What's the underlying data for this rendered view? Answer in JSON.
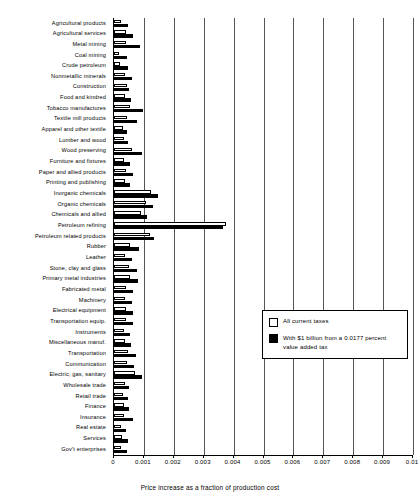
{
  "chart_data": {
    "type": "bar",
    "orientation": "horizontal",
    "title": "",
    "xlabel": "Price increase as a fraction of production cost",
    "ylabel": "",
    "xlim": [
      0,
      0.01
    ],
    "xticks": [
      "0",
      "0.001",
      "0.002",
      "0.003",
      "0.004",
      "0.005",
      "0.006",
      "0.007",
      "0.008",
      "0.009",
      "0.01"
    ],
    "xtick_values": [
      0,
      0.001,
      0.002,
      0.003,
      0.004,
      0.005,
      0.006,
      0.007,
      0.008,
      0.009,
      0.01
    ],
    "grid": "vertical",
    "legend_position": "center-right",
    "categories": [
      "Agricultural products",
      "Agricultural services",
      "Metal mining",
      "Coal mining",
      "Crude petroleum",
      "Nonmetallic minerals",
      "Construction",
      "Food and kindred",
      "Tobacco manufactures",
      "Textile mill products",
      "Apparel and other textile",
      "Lumber and wood",
      "Wood preserving",
      "Furniture and fixtures",
      "Paper and allied products",
      "Printing and publishing",
      "Inorganic chemicals",
      "Organic chemicals",
      "Chemicals and allied",
      "Petroleum refining",
      "Petroleum related products",
      "Rubber",
      "Leather",
      "Stone, clay and glass",
      "Primary metal industries",
      "Fabricated metal",
      "Machinery",
      "Electrical equipment",
      "Transportation equip.",
      "Instruments",
      "Miscellaneous manuf.",
      "Transportation",
      "Communication",
      "Electric, gas, sanitary",
      "Wholesale trade",
      "Retail trade",
      "Finance",
      "Insurance",
      "Real estate",
      "Services",
      "Gov't enterprises"
    ],
    "series": [
      {
        "name": "All current taxes",
        "fill": "#ffffff",
        "values": [
          0.00022,
          0.0004,
          0.00041,
          0.00018,
          0.0002,
          0.00036,
          0.00042,
          0.00036,
          0.00055,
          0.00042,
          0.00029,
          0.00033,
          0.0006,
          0.00035,
          0.0004,
          0.00037,
          0.00125,
          0.00108,
          0.0009,
          0.00375,
          0.00122,
          0.00055,
          0.00038,
          0.0005,
          0.00054,
          0.00041,
          0.00037,
          0.00041,
          0.00041,
          0.00033,
          0.00037,
          0.00048,
          0.00045,
          0.0007,
          0.00036,
          0.0003,
          0.00033,
          0.00035,
          0.00024,
          0.00027,
          0.00024
        ]
      },
      {
        "name": "With $1 billion from a 0.0177 percent value added tax",
        "fill": "#000000",
        "values": [
          0.00048,
          0.00063,
          0.00087,
          0.00043,
          0.00046,
          0.0006,
          0.0005,
          0.00058,
          0.00098,
          0.00078,
          0.00043,
          0.00048,
          0.00095,
          0.00055,
          0.00062,
          0.00052,
          0.00147,
          0.00132,
          0.00112,
          0.00365,
          0.00133,
          0.00083,
          0.00061,
          0.00077,
          0.0008,
          0.00063,
          0.0006,
          0.00065,
          0.00065,
          0.00053,
          0.00058,
          0.00072,
          0.00068,
          0.00092,
          0.00051,
          0.00047,
          0.00051,
          0.00062,
          0.00041,
          0.00046,
          0.00043
        ]
      }
    ]
  },
  "legend": {
    "entries": [
      {
        "label": "All current taxes"
      },
      {
        "label": "With $1 billion from a 0.0177 percent value added tax"
      }
    ]
  }
}
